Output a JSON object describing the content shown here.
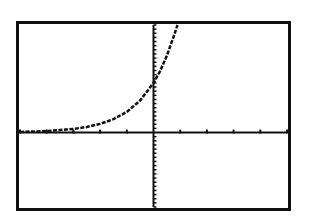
{
  "screen": {
    "frame_color": "#111111",
    "background": "#ffffff"
  },
  "chart_data": {
    "type": "line",
    "title": "",
    "xlabel": "",
    "ylabel": "",
    "xlim": [
      -5,
      5
    ],
    "ylim": [
      -18,
      26
    ],
    "xscale": 1,
    "yscale": 1,
    "grid": false,
    "legend": null,
    "series": [
      {
        "name": "y = 12·2.4^x",
        "x": [
          -5,
          -4,
          -3,
          -2.5,
          -2,
          -1.5,
          -1,
          -0.5,
          0,
          0.25,
          0.5,
          0.75,
          0.9
        ],
        "values": [
          0.15,
          0.36,
          0.87,
          1.35,
          2.08,
          3.23,
          5.0,
          7.75,
          12.0,
          14.9,
          18.6,
          23.1,
          26.0
        ]
      }
    ]
  }
}
